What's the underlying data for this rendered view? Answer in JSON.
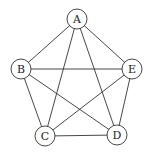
{
  "diagram": {
    "type": "complete-graph",
    "title": "",
    "stroke_color": "#333333",
    "node_fill": "#ffffff",
    "node_radius": 10,
    "nodes": [
      {
        "id": "A",
        "label": "A",
        "x": 77,
        "y": 19
      },
      {
        "id": "B",
        "label": "B",
        "x": 21,
        "y": 69
      },
      {
        "id": "E",
        "label": "E",
        "x": 132,
        "y": 69
      },
      {
        "id": "C",
        "label": "C",
        "x": 45,
        "y": 136
      },
      {
        "id": "D",
        "label": "D",
        "x": 117,
        "y": 135
      }
    ],
    "edges": [
      [
        "A",
        "B"
      ],
      [
        "A",
        "E"
      ],
      [
        "A",
        "C"
      ],
      [
        "A",
        "D"
      ],
      [
        "B",
        "E"
      ],
      [
        "B",
        "C"
      ],
      [
        "B",
        "D"
      ],
      [
        "E",
        "C"
      ],
      [
        "E",
        "D"
      ],
      [
        "C",
        "D"
      ]
    ]
  }
}
